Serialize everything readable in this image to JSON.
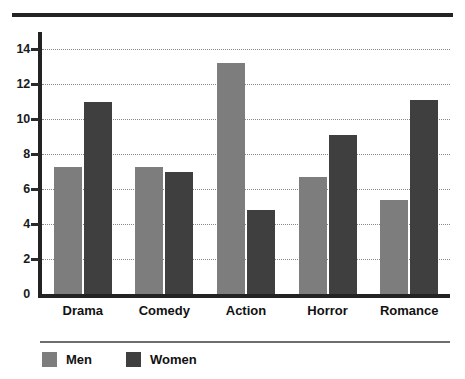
{
  "chart_data": {
    "type": "bar",
    "title": "",
    "subtitle": "",
    "xlabel": "",
    "ylabel": "",
    "categories": [
      "Drama",
      "Comedy",
      "Action",
      "Horror",
      "Romance"
    ],
    "series": [
      {
        "name": "Men",
        "color": "#7d7d7d",
        "values": [
          7.3,
          7.3,
          13.2,
          6.7,
          5.4
        ]
      },
      {
        "name": "Women",
        "color": "#3f3f3f",
        "values": [
          11.0,
          7.0,
          4.8,
          9.1,
          11.1
        ]
      }
    ],
    "ylim": [
      0,
      15
    ],
    "yticks": [
      0,
      2,
      4,
      6,
      8,
      10,
      12,
      14
    ],
    "ytick_labels": [
      "0",
      "2",
      "4",
      "6",
      "8",
      "10",
      "12",
      "14"
    ],
    "grid": true,
    "grid_style": "dotted",
    "grid_axis": "y",
    "legend_position": "bottom-left",
    "axis_color": "#232323",
    "grid_color": "#8a8a8a",
    "background": "#ffffff"
  },
  "decor": {
    "top_rule_color": "#232323",
    "legend_rule_color": "#6e6e6e"
  }
}
